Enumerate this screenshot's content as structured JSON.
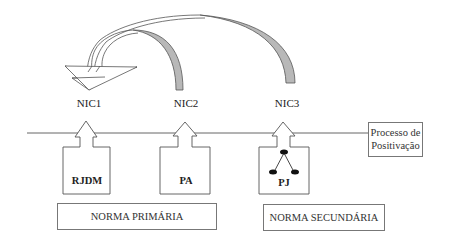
{
  "nodes": {
    "nic1": "NIC1",
    "nic2": "NIC2",
    "nic3": "NIC3"
  },
  "boxes": {
    "rjdm": "RJDM",
    "pa": "PA",
    "pj": "PJ"
  },
  "norms": {
    "primary": "NORMA PRIMÁRIA",
    "secondary": "NORMA SECUNDÁRIA"
  },
  "process": {
    "line1": "Processo de",
    "line2": "Positivação"
  },
  "colors": {
    "arc_fill": "#b8b8b8",
    "stroke": "#555555"
  }
}
